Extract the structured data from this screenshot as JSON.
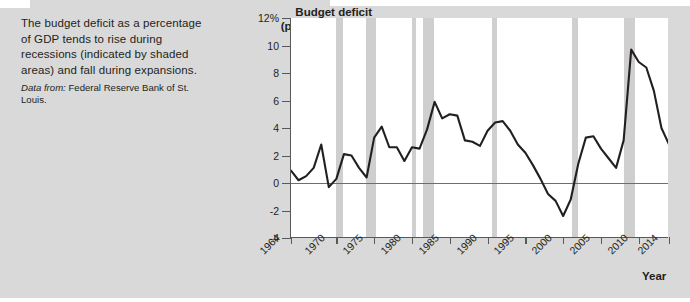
{
  "caption": {
    "body": "The budget deficit as a percentage of GDP tends to rise during recessions (indicated by shaded areas) and fall during expansions.",
    "source_lead": "Data from:",
    "source_text": " Federal Reserve Bank of St. Louis."
  },
  "colors": {
    "card_background": "#d9d9d9",
    "plot_background": "#ffffff",
    "axis": "#58595b",
    "series_line": "#231f20",
    "recession_band": "#cfcfcf",
    "zero_line": "#6d6e71"
  },
  "chart_data": {
    "type": "line",
    "title": "Budget deficit (percent of GDP)",
    "title_line1": "Budget deficit",
    "title_line2": "(percent of GDP)",
    "xlabel": "Year",
    "ylabel": "Budget deficit (percent of GDP)",
    "xlim": [
      1964,
      2014
    ],
    "ylim": [
      -4,
      12
    ],
    "grid": false,
    "legend": null,
    "ytick_labels": [
      "12%",
      "10",
      "8",
      "6",
      "4",
      "2",
      "0",
      "-2",
      "-4"
    ],
    "ytick_values": [
      12,
      10,
      8,
      6,
      4,
      2,
      0,
      -2,
      -4
    ],
    "xtick_labels": [
      "1964",
      "1970",
      "1975",
      "1980",
      "1985",
      "1990",
      "1995",
      "2000",
      "2005",
      "2010",
      "2014"
    ],
    "xtick_values": [
      1964,
      1970,
      1975,
      1980,
      1985,
      1990,
      1995,
      2000,
      2005,
      2010,
      2014
    ],
    "x": [
      1964,
      1965,
      1966,
      1967,
      1968,
      1969,
      1970,
      1971,
      1972,
      1973,
      1974,
      1975,
      1976,
      1977,
      1978,
      1979,
      1980,
      1981,
      1982,
      1983,
      1984,
      1985,
      1986,
      1987,
      1988,
      1989,
      1990,
      1991,
      1992,
      1993,
      1994,
      1995,
      1996,
      1997,
      1998,
      1999,
      2000,
      2001,
      2002,
      2003,
      2004,
      2005,
      2006,
      2007,
      2008,
      2009,
      2010,
      2011,
      2012,
      2013,
      2014
    ],
    "values": [
      0.9,
      0.2,
      0.5,
      1.1,
      2.8,
      -0.3,
      0.3,
      2.1,
      2.0,
      1.1,
      0.4,
      3.3,
      4.1,
      2.6,
      2.6,
      1.6,
      2.6,
      2.5,
      3.9,
      5.9,
      4.7,
      5.0,
      4.9,
      3.1,
      3.0,
      2.7,
      3.8,
      4.4,
      4.5,
      3.8,
      2.8,
      2.2,
      1.3,
      0.3,
      -0.8,
      -1.3,
      -2.4,
      -1.2,
      1.4,
      3.3,
      3.4,
      2.5,
      1.8,
      1.1,
      3.1,
      9.7,
      8.8,
      8.4,
      6.7,
      4.0,
      2.8
    ],
    "recessions": [
      {
        "label": "1969-1970",
        "start": 1969.9,
        "end": 1970.9
      },
      {
        "label": "1973-1975",
        "start": 1973.9,
        "end": 1975.2
      },
      {
        "label": "1980",
        "start": 1980.0,
        "end": 1980.5
      },
      {
        "label": "1981-1982",
        "start": 1981.5,
        "end": 1982.9
      },
      {
        "label": "1990-1991",
        "start": 1990.6,
        "end": 1991.2
      },
      {
        "label": "2001",
        "start": 2001.2,
        "end": 2001.9
      },
      {
        "label": "2007-2009",
        "start": 2008.0,
        "end": 2009.5
      }
    ]
  }
}
